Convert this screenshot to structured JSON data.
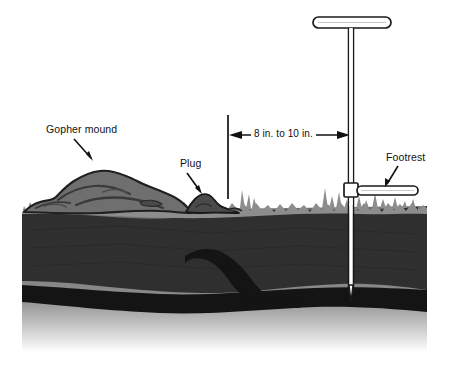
{
  "figure": {
    "type": "technical-illustration",
    "background_color": "#ffffff"
  },
  "labels": {
    "gopher_mound": "Gopher mound",
    "plug": "Plug",
    "footrest": "Footrest",
    "dimension": "8 in. to 10 in."
  },
  "colors": {
    "outline": "#111111",
    "grass": "#8d8d8d",
    "mound": "#6f6f6f",
    "mound_shadow": "#4a4a4a",
    "topsoil": "#2f2f2f",
    "subsoil": "#6b6b6b",
    "tunnel": "#141414",
    "probe_fill": "#ffffff",
    "probe_outline": "#1a1a1a"
  },
  "measurements": {
    "probe_offset_from_plug": "8 in. to 10 in."
  },
  "parts": [
    {
      "name": "gopher-mound",
      "label": "Gopher mound"
    },
    {
      "name": "plug",
      "label": "Plug"
    },
    {
      "name": "probe",
      "label": ""
    },
    {
      "name": "footrest",
      "label": "Footrest"
    },
    {
      "name": "burrow-tunnel",
      "label": ""
    }
  ]
}
